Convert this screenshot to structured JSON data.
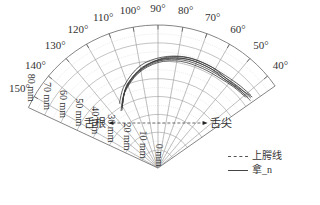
{
  "chart_data": {
    "type": "polar-line",
    "title": "",
    "angular_axis": {
      "range_deg": [
        35,
        155
      ],
      "tick_labels": [
        "40°",
        "50°",
        "60°",
        "70°",
        "80°",
        "90°",
        "100°",
        "110°",
        "120°",
        "130°",
        "140°",
        "150°"
      ],
      "tick_values_deg": [
        40,
        50,
        60,
        70,
        80,
        90,
        100,
        110,
        120,
        130,
        140,
        150
      ]
    },
    "radial_axis": {
      "unit": "mm",
      "range": [
        0,
        80
      ],
      "tick_labels": [
        "0 mm",
        "10 mm",
        "20 mm",
        "30 mm",
        "40 mm",
        "50 mm",
        "60 mm",
        "70 mm",
        "80 mm"
      ],
      "tick_values": [
        0,
        10,
        20,
        30,
        40,
        50,
        60,
        70,
        80
      ],
      "label_angle_deg": 145
    },
    "grid": true,
    "annotations": {
      "left": "舌根",
      "right": "舌尖",
      "arrow_radius_mm": 30
    },
    "legend": [
      {
        "label": "上腭线",
        "style": "dashed",
        "color": "#555555"
      },
      {
        "label": "拿_n",
        "style": "solid",
        "color": "#444444"
      }
    ],
    "series": [
      {
        "name": "拿_n",
        "points_polar": [
          [
            121,
            39
          ],
          [
            112,
            48
          ],
          [
            100,
            56
          ],
          [
            88,
            61
          ],
          [
            76,
            63
          ],
          [
            64,
            63
          ],
          [
            54,
            63
          ],
          [
            45,
            64
          ],
          [
            37,
            65
          ]
        ]
      },
      {
        "name": "拿_n",
        "points_polar": [
          [
            122,
            38
          ],
          [
            113,
            47
          ],
          [
            101,
            55
          ],
          [
            89,
            60
          ],
          [
            77,
            62
          ],
          [
            65,
            62
          ],
          [
            55,
            62
          ],
          [
            46,
            63
          ],
          [
            38,
            64
          ]
        ]
      },
      {
        "name": "拿_n",
        "points_polar": [
          [
            120,
            40
          ],
          [
            111,
            49
          ],
          [
            99,
            57
          ],
          [
            87,
            61
          ],
          [
            75,
            63
          ],
          [
            63,
            63
          ],
          [
            53,
            62
          ],
          [
            44,
            63
          ],
          [
            36,
            64
          ]
        ]
      },
      {
        "name": "拿_n",
        "points_polar": [
          [
            123,
            38
          ],
          [
            114,
            46
          ],
          [
            102,
            54
          ],
          [
            90,
            59
          ],
          [
            78,
            61
          ],
          [
            66,
            61
          ],
          [
            56,
            61
          ],
          [
            47,
            62
          ],
          [
            39,
            63
          ]
        ]
      },
      {
        "name": "拿_n",
        "points_polar": [
          [
            119,
            41
          ],
          [
            110,
            50
          ],
          [
            98,
            57
          ],
          [
            86,
            62
          ],
          [
            74,
            64
          ],
          [
            62,
            64
          ],
          [
            52,
            63
          ],
          [
            43,
            64
          ],
          [
            37,
            66
          ]
        ]
      },
      {
        "name": "拿_n",
        "points_polar": [
          [
            121,
            42
          ],
          [
            112,
            50
          ],
          [
            100,
            58
          ],
          [
            88,
            62
          ],
          [
            76,
            64
          ],
          [
            64,
            64
          ],
          [
            54,
            64
          ],
          [
            45,
            65
          ],
          [
            38,
            66
          ]
        ]
      }
    ]
  }
}
